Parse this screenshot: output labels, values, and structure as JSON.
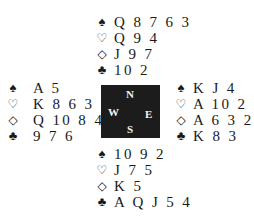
{
  "suits": {
    "spades": "♠",
    "hearts": "♡",
    "diamonds": "◇",
    "clubs": "♣"
  },
  "compass": {
    "north": "N",
    "south": "S",
    "west": "W",
    "east": "E",
    "background": "#1c1c1c"
  },
  "hands": {
    "north": {
      "spades": "Q 8 7 6 3",
      "hearts": "Q 9 4",
      "diamonds": "J 9 7",
      "clubs": "10 2"
    },
    "west": {
      "spades": "A 5",
      "hearts": "K 8 6 3",
      "diamonds": "Q 10 8 4",
      "clubs": "9 7 6"
    },
    "east": {
      "spades": "K J 4",
      "hearts": "A 10 2",
      "diamonds": "A 6 3 2",
      "clubs": "K 8 3"
    },
    "south": {
      "spades": "10 9 2",
      "hearts": "J 7 5",
      "diamonds": "K 5",
      "clubs": "A Q J 5 4"
    }
  }
}
